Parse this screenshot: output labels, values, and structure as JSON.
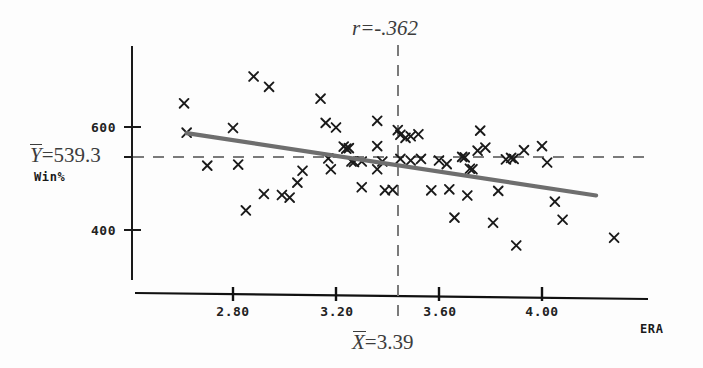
{
  "chart_data": {
    "type": "scatter",
    "title": "",
    "xlabel": "ERA",
    "ylabel": "Win%",
    "xlim": [
      2.55,
      4.35
    ],
    "ylim": [
      330,
      690
    ],
    "grid": false,
    "legend": "none",
    "xticks": [
      "2.80",
      "3.20",
      "3.60",
      "4.00"
    ],
    "xtick_values": [
      2.8,
      3.2,
      3.6,
      4.0
    ],
    "yticks": [
      "600",
      "400"
    ],
    "ytick_values": [
      600,
      400
    ],
    "annotations": {
      "correlation_label": "r=-.362",
      "correlation_value": -0.362,
      "x_mean_label": "X=3.39",
      "x_mean_var": "X",
      "x_mean_eq": "=3.39",
      "x_mean_value": 3.39,
      "y_mean_label": "Y=539.3",
      "y_mean_var": "Y",
      "y_mean_eq": "=539.3",
      "y_mean_value": 539.3
    },
    "regression_line": {
      "x_start": 2.62,
      "y_start": 588,
      "x_end": 4.21,
      "y_end": 467,
      "color": "#6e6e6e"
    },
    "marker": "x",
    "marker_color": "#1a1a1a",
    "points": [
      {
        "x": 2.61,
        "y": 646
      },
      {
        "x": 2.62,
        "y": 589
      },
      {
        "x": 2.7,
        "y": 525
      },
      {
        "x": 2.8,
        "y": 598
      },
      {
        "x": 2.82,
        "y": 527
      },
      {
        "x": 2.85,
        "y": 438
      },
      {
        "x": 2.88,
        "y": 698
      },
      {
        "x": 2.94,
        "y": 678
      },
      {
        "x": 2.92,
        "y": 470
      },
      {
        "x": 2.99,
        "y": 468
      },
      {
        "x": 3.02,
        "y": 463
      },
      {
        "x": 3.05,
        "y": 492
      },
      {
        "x": 3.07,
        "y": 515
      },
      {
        "x": 3.14,
        "y": 655
      },
      {
        "x": 3.16,
        "y": 608
      },
      {
        "x": 3.17,
        "y": 539
      },
      {
        "x": 3.18,
        "y": 518
      },
      {
        "x": 3.2,
        "y": 599
      },
      {
        "x": 3.23,
        "y": 562
      },
      {
        "x": 3.24,
        "y": 558
      },
      {
        "x": 3.25,
        "y": 559
      },
      {
        "x": 3.26,
        "y": 533
      },
      {
        "x": 3.27,
        "y": 532
      },
      {
        "x": 3.3,
        "y": 533
      },
      {
        "x": 3.3,
        "y": 483
      },
      {
        "x": 3.36,
        "y": 612
      },
      {
        "x": 3.36,
        "y": 563
      },
      {
        "x": 3.36,
        "y": 518
      },
      {
        "x": 3.38,
        "y": 533
      },
      {
        "x": 3.39,
        "y": 477
      },
      {
        "x": 3.42,
        "y": 478
      },
      {
        "x": 3.44,
        "y": 594
      },
      {
        "x": 3.45,
        "y": 585
      },
      {
        "x": 3.45,
        "y": 538
      },
      {
        "x": 3.47,
        "y": 579
      },
      {
        "x": 3.49,
        "y": 582
      },
      {
        "x": 3.49,
        "y": 535
      },
      {
        "x": 3.52,
        "y": 586
      },
      {
        "x": 3.53,
        "y": 538
      },
      {
        "x": 3.57,
        "y": 477
      },
      {
        "x": 3.6,
        "y": 535
      },
      {
        "x": 3.63,
        "y": 528
      },
      {
        "x": 3.64,
        "y": 479
      },
      {
        "x": 3.66,
        "y": 424
      },
      {
        "x": 3.69,
        "y": 542
      },
      {
        "x": 3.7,
        "y": 541
      },
      {
        "x": 3.71,
        "y": 467
      },
      {
        "x": 3.72,
        "y": 519
      },
      {
        "x": 3.73,
        "y": 518
      },
      {
        "x": 3.75,
        "y": 554
      },
      {
        "x": 3.76,
        "y": 593
      },
      {
        "x": 3.78,
        "y": 560
      },
      {
        "x": 3.81,
        "y": 414
      },
      {
        "x": 3.83,
        "y": 476
      },
      {
        "x": 3.86,
        "y": 537
      },
      {
        "x": 3.88,
        "y": 540
      },
      {
        "x": 3.89,
        "y": 538
      },
      {
        "x": 3.9,
        "y": 370
      },
      {
        "x": 3.93,
        "y": 555
      },
      {
        "x": 4.0,
        "y": 563
      },
      {
        "x": 4.02,
        "y": 531
      },
      {
        "x": 4.05,
        "y": 455
      },
      {
        "x": 4.08,
        "y": 420
      },
      {
        "x": 4.28,
        "y": 385
      }
    ]
  }
}
